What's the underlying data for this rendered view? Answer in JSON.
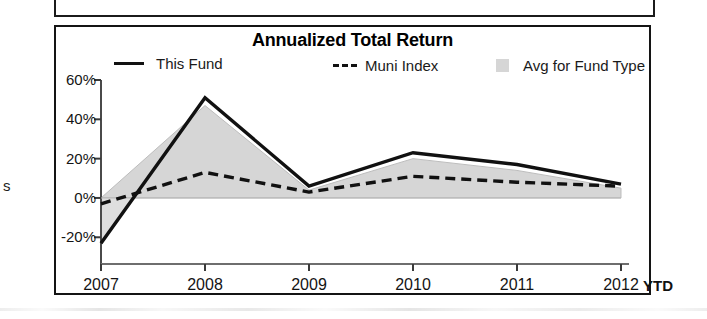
{
  "panel": {
    "left_margin_glyph": "s"
  },
  "chart": {
    "title": "Annualized Total Return",
    "legend": [
      {
        "label": "This Fund",
        "marker": "solid-line",
        "color": "#111111"
      },
      {
        "label": "Muni Index",
        "marker": "dashed-line",
        "color": "#111111"
      },
      {
        "label": "Avg for Fund Type",
        "marker": "area-swatch",
        "color": "#d6d6d6"
      }
    ],
    "x_axis": {
      "ticks": [
        "2007",
        "2008",
        "2009",
        "2010",
        "2011",
        "2012"
      ],
      "suffix_label": "YTD"
    },
    "y_axis": {
      "ticks": [
        "60%",
        "40%",
        "20%",
        "0%",
        "-20%"
      ]
    }
  },
  "chart_data": {
    "type": "line",
    "title": "Annualized Total Return",
    "xlabel": "",
    "ylabel": "",
    "x": [
      "2007",
      "2008",
      "2009",
      "2010",
      "2011",
      "2012"
    ],
    "categories": [
      "2007",
      "2008",
      "2009",
      "2010",
      "2011",
      "2012"
    ],
    "ylim": [
      -28,
      62
    ],
    "yticks": [
      -20,
      0,
      20,
      40,
      60
    ],
    "ytick_labels": [
      "-20%",
      "0%",
      "20%",
      "40%",
      "60%"
    ],
    "grid": false,
    "legend_position": "top",
    "series": [
      {
        "name": "This Fund",
        "style": "solid",
        "color": "#111111",
        "values": [
          -23,
          51,
          6,
          23,
          17,
          7
        ]
      },
      {
        "name": "Muni Index",
        "style": "dashed",
        "color": "#111111",
        "values": [
          -3,
          13,
          3,
          11,
          8,
          6
        ]
      },
      {
        "name": "Avg for Fund Type",
        "style": "area",
        "color": "#d6d6d6",
        "values": [
          0,
          47,
          4,
          20,
          14,
          5
        ]
      }
    ],
    "annotations": [
      "YTD"
    ]
  }
}
